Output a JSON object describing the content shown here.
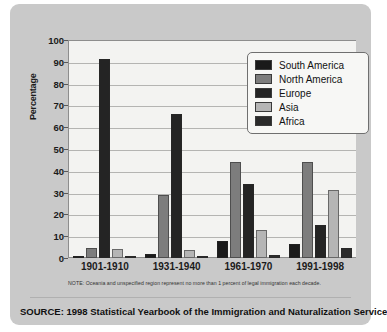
{
  "chart_data": {
    "type": "bar",
    "title": "",
    "xlabel": "",
    "ylabel": "Percentage",
    "ylim": [
      0,
      100
    ],
    "ytick_values": [
      0,
      10,
      20,
      30,
      40,
      50,
      60,
      70,
      80,
      90,
      100
    ],
    "ytick_labels": [
      "0",
      "10",
      "20",
      "30",
      "40",
      "50",
      "60",
      "70",
      "80",
      "90",
      "100"
    ],
    "grid": true,
    "legend_position": "upper right",
    "categories": [
      "1901-1910",
      "1931-1940",
      "1961-1970",
      "1991-1998"
    ],
    "series": [
      {
        "name": "South America",
        "color": "#1a1a1a",
        "values": [
          0.5,
          2,
          8,
          6.5
        ]
      },
      {
        "name": "North America",
        "color": "#7d7d7d",
        "values": [
          4.5,
          29,
          44,
          44
        ]
      },
      {
        "name": "Europe",
        "color": "#242424",
        "values": [
          91.5,
          66,
          34,
          15
        ]
      },
      {
        "name": "Asia",
        "color": "#b5b5b5",
        "values": [
          4,
          3.5,
          13,
          31
        ]
      },
      {
        "name": "Africa",
        "color": "#2b2b2b",
        "values": [
          0.3,
          0.6,
          1.5,
          4.5
        ]
      }
    ],
    "note": "NOTE: Oceania and unspecified region represent no more than 1 percent of legal immigration each decade.",
    "source": "SOURCE: 1998 Statistical Yearbook of the Immigration and Naturalization Service"
  },
  "palette": {
    "panel_background": "#c9c9c9",
    "plot_background": "#f3f3f1",
    "gridline": "#b4b4b2",
    "axis": "#8d8d8d",
    "text": "#1b1b1b"
  }
}
